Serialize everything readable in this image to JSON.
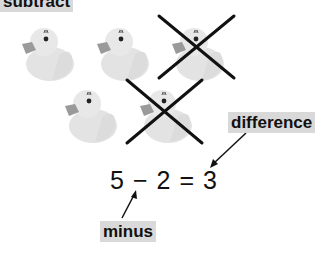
{
  "labels": {
    "top": "subtract",
    "difference": "difference",
    "minus": "minus"
  },
  "equation": {
    "left": "5",
    "operator": "−",
    "right": "2",
    "equals": "=",
    "result": "3"
  },
  "ducks": {
    "total": 5,
    "crossed_out": 2,
    "remaining": 3
  },
  "colors": {
    "label_bg": "#d9d9d9",
    "duck_body": "#e6e6e6",
    "duck_beak": "#9a9a9a",
    "cross": "#111111"
  }
}
